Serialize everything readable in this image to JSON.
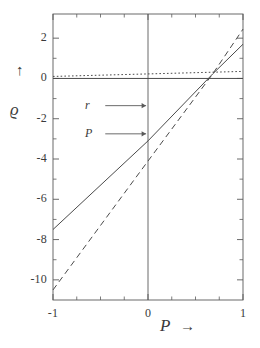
{
  "chart_data": {
    "type": "line",
    "title": "",
    "xlabel": "P",
    "ylabel": "ϱ",
    "xlabel_arrow": "→",
    "ylabel_arrow": "↑",
    "xlim": [
      -1,
      1
    ],
    "ylim": [
      -11,
      3.2
    ],
    "grid": false,
    "legend": "none",
    "x_ticks_major": [
      -1,
      0,
      1
    ],
    "x_tick_labels": [
      "-1",
      "0",
      "1"
    ],
    "x_ticks_minor": [
      -0.75,
      -0.5,
      -0.25,
      0.25,
      0.5,
      0.75
    ],
    "y_ticks_major": [
      2,
      0,
      -2,
      -4,
      -6,
      -8,
      -10
    ],
    "y_tick_labels": [
      "2",
      "0",
      "-2",
      "-4",
      "-6",
      "-8",
      "-10"
    ],
    "y_ticks_minor": [
      1,
      -1,
      -3,
      -5,
      -7,
      -9
    ],
    "zero_vertical_line_x": 0,
    "series": [
      {
        "name": "baseline-zero",
        "style": "solid",
        "color": "#4a4a4a",
        "x": [
          -1,
          1
        ],
        "y": [
          0,
          0
        ]
      },
      {
        "name": "dotted-near-zero",
        "style": "dotted",
        "color": "#4a4a4a",
        "x": [
          -1,
          1
        ],
        "y": [
          0.1,
          0.35
        ]
      },
      {
        "name": "r-solid-rising",
        "style": "solid",
        "color": "#4a4a4a",
        "x": [
          -1,
          0,
          0.68,
          1
        ],
        "y": [
          -7.5,
          -3.1,
          0.22,
          1.7
        ]
      },
      {
        "name": "P-dashed-rising",
        "style": "dashed",
        "color": "#4a4a4a",
        "x": [
          -1,
          0,
          0.68,
          1
        ],
        "y": [
          -10.5,
          -4.1,
          0.22,
          2.45
        ]
      }
    ],
    "annotations": [
      {
        "name": "r",
        "label": "r",
        "x_text": -0.62,
        "y_text": -1.35,
        "arrow_from_x": -0.45,
        "arrow_to_x": -0.02,
        "arrow_y": -1.35
      },
      {
        "name": "P",
        "label": "P",
        "x_text": -0.62,
        "y_text": -2.75,
        "arrow_from_x": -0.45,
        "arrow_to_x": -0.02,
        "arrow_y": -2.75
      }
    ]
  },
  "axes": {
    "y_axis_title": "ϱ",
    "y_axis_arrow": "↑",
    "x_axis_title": "P",
    "x_axis_arrow": "→"
  }
}
